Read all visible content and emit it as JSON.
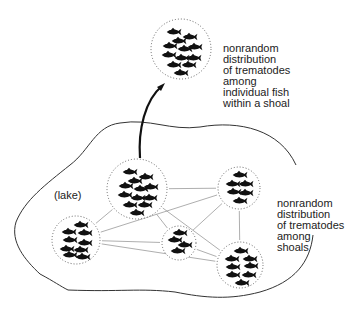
{
  "labels": {
    "top": [
      "nonrandom",
      "distribution",
      "of trematodes",
      "among",
      "individual fish",
      "within a shoal"
    ],
    "right": [
      "nonrandom",
      "distribution",
      "of trematodes",
      "among",
      "shoals"
    ],
    "lake": "(lake)"
  },
  "shoals": [
    {
      "id": "inset",
      "cx": 181,
      "cy": 49,
      "r": 30,
      "fish": [
        [
          -8,
          -17
        ],
        [
          8,
          -12
        ],
        [
          -3,
          -8
        ],
        [
          -12,
          -3
        ],
        [
          3,
          0
        ],
        [
          13,
          -2
        ],
        [
          -13,
          6
        ],
        [
          0,
          9
        ],
        [
          12,
          9
        ],
        [
          -8,
          16
        ],
        [
          7,
          16
        ],
        [
          -1,
          24
        ]
      ]
    },
    {
      "id": "main",
      "cx": 137,
      "cy": 189,
      "r": 30,
      "fish": [
        [
          -8,
          -17
        ],
        [
          8,
          -12
        ],
        [
          -3,
          -8
        ],
        [
          -12,
          -3
        ],
        [
          3,
          0
        ],
        [
          13,
          -2
        ],
        [
          -13,
          6
        ],
        [
          0,
          9
        ],
        [
          12,
          9
        ],
        [
          -8,
          16
        ],
        [
          7,
          16
        ],
        [
          -1,
          24
        ]
      ]
    },
    {
      "id": "right-top",
      "cx": 239,
      "cy": 188,
      "r": 21,
      "fish": [
        [
          0,
          -13
        ],
        [
          -7,
          -4
        ],
        [
          6,
          -4
        ],
        [
          -6,
          4
        ],
        [
          6,
          5
        ],
        [
          0,
          13
        ]
      ]
    },
    {
      "id": "left",
      "cx": 76,
      "cy": 240,
      "r": 24,
      "fish": [
        [
          4,
          -15
        ],
        [
          -8,
          -8
        ],
        [
          8,
          -7
        ],
        [
          -7,
          0
        ],
        [
          8,
          3
        ],
        [
          -10,
          9
        ],
        [
          4,
          10
        ],
        [
          -7,
          15
        ],
        [
          6,
          17
        ]
      ]
    },
    {
      "id": "small",
      "cx": 179,
      "cy": 243,
      "r": 17,
      "fish": [
        [
          0,
          -10
        ],
        [
          -5,
          -3
        ],
        [
          5,
          2
        ],
        [
          -2,
          8
        ]
      ]
    },
    {
      "id": "bottom-right",
      "cx": 240,
      "cy": 265,
      "r": 23,
      "fish": [
        [
          0,
          -14
        ],
        [
          -9,
          -6
        ],
        [
          9,
          -6
        ],
        [
          -8,
          2
        ],
        [
          10,
          1
        ],
        [
          -8,
          10
        ],
        [
          8,
          10
        ],
        [
          1,
          18
        ]
      ]
    }
  ],
  "links": [
    [
      "main",
      "right-top"
    ],
    [
      "main",
      "left"
    ],
    [
      "main",
      "small"
    ],
    [
      "main",
      "bottom-right"
    ],
    [
      "left",
      "right-top"
    ],
    [
      "left",
      "small"
    ],
    [
      "left",
      "bottom-right"
    ],
    [
      "small",
      "right-top"
    ],
    [
      "small",
      "bottom-right"
    ],
    [
      "right-top",
      "bottom-right"
    ]
  ]
}
